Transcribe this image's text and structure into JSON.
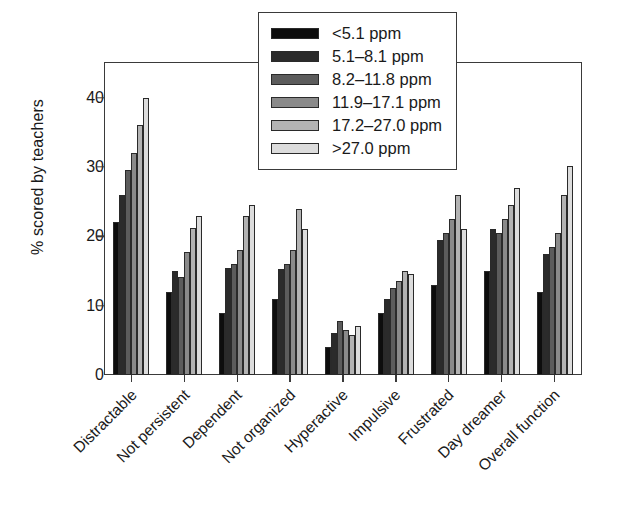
{
  "chart_data": {
    "type": "bar",
    "title": "",
    "xlabel": "",
    "ylabel": "% scored by teachers",
    "ylim": [
      0,
      45
    ],
    "yticks": [
      0,
      10,
      20,
      30,
      40
    ],
    "grid": false,
    "legend_position": "top-center",
    "categories": [
      "Distractable",
      "Not persistent",
      "Dependent",
      "Not organized",
      "Hyperactive",
      "Impulsive",
      "Frustrated",
      "Day dreamer",
      "Overall function"
    ],
    "series": [
      {
        "name": "<5.1 ppm",
        "color": "#0d0d0d",
        "values": [
          22.0,
          12.0,
          9.0,
          11.0,
          4.0,
          9.0,
          13.0,
          15.0,
          12.0
        ]
      },
      {
        "name": "5.1–8.1 ppm",
        "color": "#2b2b2b",
        "values": [
          26.0,
          15.0,
          15.5,
          15.3,
          6.0,
          11.0,
          19.5,
          21.0,
          17.5
        ]
      },
      {
        "name": "8.2–11.8 ppm",
        "color": "#5c5c5c",
        "values": [
          29.5,
          14.2,
          16.0,
          16.0,
          7.8,
          12.5,
          20.5,
          20.5,
          18.5
        ]
      },
      {
        "name": "11.9–17.1 ppm",
        "color": "#8a8a8a",
        "values": [
          32.0,
          17.8,
          18.0,
          18.0,
          6.5,
          13.5,
          22.5,
          22.5,
          20.5
        ]
      },
      {
        "name": "17.2–27.0 ppm",
        "color": "#b3b3b3",
        "values": [
          36.0,
          21.2,
          23.0,
          24.0,
          5.8,
          15.0,
          26.0,
          24.5,
          26.0
        ]
      },
      {
        "name": ">27.0 ppm",
        "color": "#dcdcdc",
        "values": [
          40.0,
          23.0,
          24.5,
          21.0,
          7.0,
          14.5,
          21.0,
          27.0,
          30.2
        ]
      }
    ]
  }
}
